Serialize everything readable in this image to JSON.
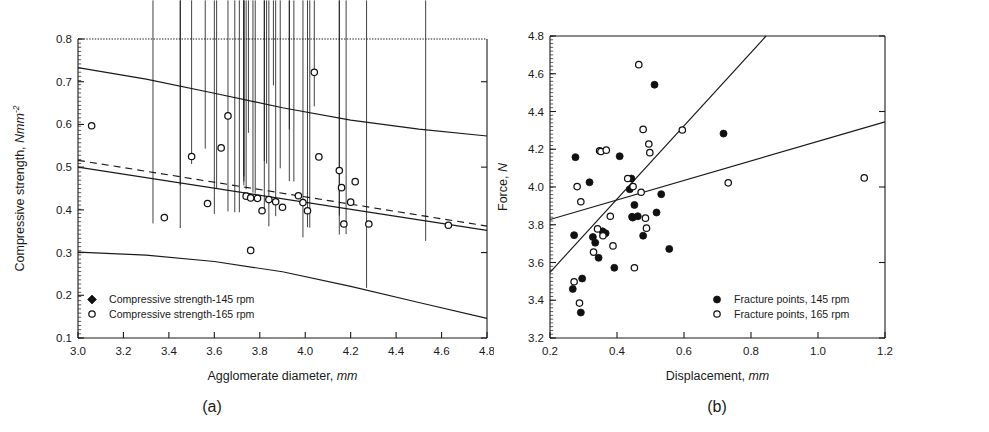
{
  "figure": {
    "panel_a_caption": "(a)",
    "panel_b_caption": "(b)"
  },
  "chart_data": [
    {
      "id": "panel_a",
      "type": "scatter",
      "title": "",
      "xlabel_text": "Agglomerate diameter, ",
      "xlabel_unit": "mm",
      "ylabel_text": "Compressive strength, ",
      "ylabel_unit": "Nmm",
      "ylabel_exponent": "-2",
      "xlim": [
        3.0,
        4.8
      ],
      "ylim": [
        0.1,
        0.8
      ],
      "xticks": [
        "3.0",
        "3.2",
        "3.4",
        "3.6",
        "3.8",
        "4.0",
        "4.2",
        "4.4",
        "4.6",
        "4.8"
      ],
      "yticks": [
        "0.1",
        "0.2",
        "0.3",
        "0.4",
        "0.5",
        "0.6",
        "0.7",
        "0.8"
      ],
      "grid": false,
      "legend_position": "bottom-left",
      "legend": [
        {
          "label": "Compressive strength-145 rpm",
          "marker": "filled-diamond"
        },
        {
          "label": "Compressive strength-165 rpm",
          "marker": "open-circle"
        }
      ],
      "series": [
        {
          "name": "Compressive strength-145 rpm",
          "marker": "filled-diamond",
          "points": [
            [
              3.33,
              0.358
            ],
            [
              3.45,
              0.347
            ],
            [
              3.45,
              0.447
            ],
            [
              3.5,
              0.497
            ],
            [
              3.56,
              0.533
            ],
            [
              3.6,
              0.38
            ],
            [
              3.61,
              0.441
            ],
            [
              3.66,
              0.386
            ],
            [
              3.69,
              0.384
            ],
            [
              3.71,
              0.384
            ],
            [
              3.73,
              0.468
            ],
            [
              3.73,
              0.456
            ],
            [
              3.73,
              0.447
            ],
            [
              3.74,
              0.438
            ],
            [
              3.75,
              0.57
            ],
            [
              3.77,
              0.43
            ],
            [
              3.78,
              0.428
            ],
            [
              3.82,
              0.383
            ],
            [
              3.82,
              0.504
            ],
            [
              3.83,
              0.498
            ],
            [
              3.84,
              0.351
            ],
            [
              3.86,
              0.681
            ],
            [
              3.87,
              0.375
            ],
            [
              3.89,
              0.487
            ],
            [
              3.93,
              0.578
            ],
            [
              3.93,
              0.457
            ],
            [
              3.95,
              0.456
            ],
            [
              3.99,
              0.325
            ],
            [
              4.01,
              0.349
            ],
            [
              4.02,
              0.348
            ],
            [
              4.04,
              0.632
            ],
            [
              4.15,
              0.376
            ],
            [
              4.15,
              0.332
            ],
            [
              4.18,
              0.333
            ],
            [
              4.27,
              0.207
            ],
            [
              4.53,
              0.317
            ]
          ]
        },
        {
          "name": "Compressive strength-165 rpm",
          "marker": "open-circle",
          "points": [
            [
              3.06,
              0.597
            ],
            [
              3.38,
              0.382
            ],
            [
              3.5,
              0.525
            ],
            [
              3.57,
              0.415
            ],
            [
              3.63,
              0.545
            ],
            [
              3.66,
              0.62
            ],
            [
              3.74,
              0.432
            ],
            [
              3.76,
              0.428
            ],
            [
              3.76,
              0.305
            ],
            [
              3.79,
              0.427
            ],
            [
              3.81,
              0.398
            ],
            [
              3.84,
              0.424
            ],
            [
              3.87,
              0.419
            ],
            [
              3.9,
              0.406
            ],
            [
              3.97,
              0.433
            ],
            [
              3.99,
              0.417
            ],
            [
              4.01,
              0.398
            ],
            [
              4.04,
              0.722
            ],
            [
              4.06,
              0.524
            ],
            [
              4.15,
              0.492
            ],
            [
              4.16,
              0.452
            ],
            [
              4.17,
              0.367
            ],
            [
              4.2,
              0.418
            ],
            [
              4.22,
              0.466
            ],
            [
              4.28,
              0.367
            ],
            [
              4.63,
              0.364
            ]
          ]
        }
      ],
      "fit_lines": [
        {
          "name": "regression-solid",
          "style": "solid",
          "x1": 3.0,
          "y1": 0.5,
          "x2": 4.8,
          "y2": 0.352
        },
        {
          "name": "regression-dashed",
          "style": "dashed",
          "x1": 3.0,
          "y1": 0.516,
          "x2": 4.8,
          "y2": 0.362
        }
      ],
      "confidence_bands": [
        {
          "name": "upper-confidence-band",
          "points": [
            [
              3.0,
              0.733
            ],
            [
              3.3,
              0.706
            ],
            [
              3.6,
              0.673
            ],
            [
              3.9,
              0.639
            ],
            [
              4.2,
              0.61
            ],
            [
              4.5,
              0.589
            ],
            [
              4.8,
              0.573
            ]
          ]
        },
        {
          "name": "lower-confidence-band",
          "points": [
            [
              3.0,
              0.301
            ],
            [
              3.3,
              0.294
            ],
            [
              3.6,
              0.279
            ],
            [
              3.9,
              0.255
            ],
            [
              4.2,
              0.221
            ],
            [
              4.5,
              0.183
            ],
            [
              4.8,
              0.146
            ]
          ]
        }
      ]
    },
    {
      "id": "panel_b",
      "type": "scatter",
      "title": "",
      "xlabel_text": "Displacement, ",
      "xlabel_unit": "mm",
      "ylabel_text": "Force, ",
      "ylabel_unit": "N",
      "xlim": [
        0.2,
        1.2
      ],
      "ylim": [
        3.2,
        4.8
      ],
      "xticks": [
        "0.2",
        "0.4",
        "0.6",
        "0.8",
        "1.0",
        "1.2"
      ],
      "yticks": [
        "3.2",
        "3.4",
        "3.6",
        "3.8",
        "4.0",
        "4.2",
        "4.4",
        "4.6",
        "4.8"
      ],
      "grid": false,
      "legend_position": "bottom-right",
      "legend": [
        {
          "label": "Fracture points, 145 rpm",
          "marker": "filled-circle"
        },
        {
          "label": "Fracture points, 165 rpm",
          "marker": "open-circle"
        }
      ],
      "series": [
        {
          "name": "Fracture points, 145 rpm",
          "marker": "filled-circle",
          "points": [
            [
              0.268,
              3.46
            ],
            [
              0.272,
              3.745
            ],
            [
              0.276,
              4.158
            ],
            [
              0.292,
              3.335
            ],
            [
              0.296,
              3.515
            ],
            [
              0.318,
              4.025
            ],
            [
              0.328,
              3.735
            ],
            [
              0.335,
              3.705
            ],
            [
              0.345,
              3.625
            ],
            [
              0.357,
              3.765
            ],
            [
              0.366,
              3.755
            ],
            [
              0.392,
              3.572
            ],
            [
              0.408,
              4.163
            ],
            [
              0.438,
              3.988
            ],
            [
              0.443,
              4.045
            ],
            [
              0.445,
              3.842
            ],
            [
              0.447,
              3.838
            ],
            [
              0.452,
              3.905
            ],
            [
              0.462,
              3.845
            ],
            [
              0.478,
              3.742
            ],
            [
              0.512,
              4.542
            ],
            [
              0.518,
              3.865
            ],
            [
              0.532,
              3.962
            ],
            [
              0.556,
              3.672
            ],
            [
              0.718,
              4.283
            ]
          ]
        },
        {
          "name": "Fracture points, 165 rpm",
          "marker": "open-circle",
          "points": [
            [
              0.272,
              3.498
            ],
            [
              0.281,
              4.002
            ],
            [
              0.288,
              3.385
            ],
            [
              0.292,
              3.922
            ],
            [
              0.33,
              3.655
            ],
            [
              0.342,
              3.778
            ],
            [
              0.348,
              4.192
            ],
            [
              0.352,
              4.188
            ],
            [
              0.358,
              3.742
            ],
            [
              0.368,
              4.195
            ],
            [
              0.38,
              3.845
            ],
            [
              0.388,
              3.688
            ],
            [
              0.432,
              4.045
            ],
            [
              0.448,
              4.002
            ],
            [
              0.452,
              3.572
            ],
            [
              0.465,
              4.648
            ],
            [
              0.472,
              3.972
            ],
            [
              0.478,
              4.305
            ],
            [
              0.485,
              3.835
            ],
            [
              0.488,
              3.782
            ],
            [
              0.495,
              4.228
            ],
            [
              0.498,
              4.182
            ],
            [
              0.595,
              4.302
            ],
            [
              0.732,
              4.022
            ],
            [
              1.138,
              4.048
            ]
          ]
        }
      ],
      "fit_lines": [
        {
          "name": "regression-145rpm-steep",
          "style": "solid",
          "x1": 0.2,
          "y1": 3.548,
          "x2": 0.845,
          "y2": 4.8
        },
        {
          "name": "regression-165rpm-shallow",
          "style": "solid",
          "x1": 0.2,
          "y1": 3.828,
          "x2": 1.2,
          "y2": 4.345
        }
      ]
    }
  ]
}
